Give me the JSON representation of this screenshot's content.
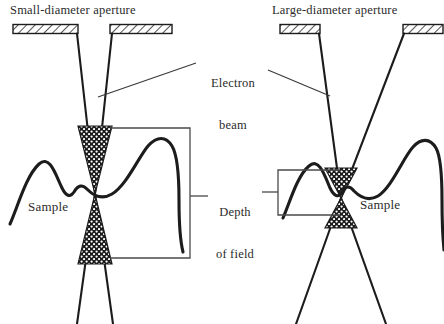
{
  "figure": {
    "type": "schematic-diagram",
    "background_color": "#ffffff",
    "line_color": "#1c1c1c",
    "text_color": "#2b2b2b"
  },
  "panels": {
    "left": {
      "title": "Small-diameter aperture",
      "sample_label": "Sample",
      "aperture_gap": "narrow",
      "convergence": "shallow-angle",
      "depth_of_field": "large",
      "dof_zone_top": 126,
      "dof_zone_bottom": 264,
      "crossover_y": 194
    },
    "right": {
      "title": "Large-diameter aperture",
      "sample_label": "Sample",
      "aperture_gap": "wide",
      "convergence": "wide-angle",
      "depth_of_field": "small",
      "dof_zone_top": 168,
      "dof_zone_bottom": 228,
      "crossover_y": 198
    }
  },
  "annotations": {
    "electron_beam": {
      "line1": "Electron",
      "line2": "beam"
    },
    "depth_of_field": {
      "line1": "Depth",
      "line2": "of field"
    }
  }
}
